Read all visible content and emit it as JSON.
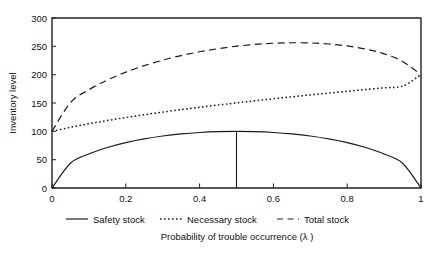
{
  "chart_data": {
    "type": "line",
    "title": "",
    "xlabel": "Probability of trouble occurrence (λ )",
    "ylabel": "Inventory level",
    "xlim": [
      0,
      1
    ],
    "ylim": [
      0,
      300
    ],
    "grid": false,
    "legend_position": "below-axis",
    "xticks": [
      "0",
      "0.2",
      "0.4",
      "0.6",
      "0.8",
      "1"
    ],
    "xtick_values": [
      0,
      0.2,
      0.4,
      0.6,
      0.8,
      1
    ],
    "yticks": [
      "0",
      "50",
      "100",
      "150",
      "200",
      "250",
      "300"
    ],
    "ytick_values": [
      0,
      50,
      100,
      150,
      200,
      250,
      300
    ],
    "x": [
      0,
      0.05,
      0.1,
      0.15,
      0.2,
      0.25,
      0.3,
      0.35,
      0.4,
      0.45,
      0.5,
      0.55,
      0.6,
      0.65,
      0.7,
      0.75,
      0.8,
      0.85,
      0.9,
      0.95,
      1
    ],
    "series": [
      {
        "name": "Safety stock",
        "style": "solid",
        "values": [
          0,
          43.6,
          60.0,
          71.4,
          80.0,
          86.6,
          91.7,
          95.4,
          98.0,
          99.5,
          100.0,
          99.5,
          98.0,
          95.4,
          91.7,
          86.6,
          80.0,
          71.4,
          60.0,
          43.6,
          0
        ]
      },
      {
        "name": "Necessary stock",
        "style": "dotted",
        "values": [
          100.0,
          107.1,
          113.4,
          119.1,
          124.4,
          129.3,
          133.9,
          138.3,
          142.4,
          146.4,
          150.2,
          153.9,
          157.5,
          160.9,
          164.3,
          167.5,
          170.7,
          173.8,
          176.8,
          179.8,
          200.0
        ]
      },
      {
        "name": "Total stock",
        "style": "dashed",
        "values": [
          100.0,
          150.7,
          173.4,
          190.5,
          204.4,
          215.9,
          225.6,
          233.7,
          240.4,
          245.9,
          250.2,
          253.4,
          255.5,
          256.3,
          256.0,
          254.1,
          250.7,
          245.2,
          236.8,
          223.4,
          200.0
        ]
      }
    ],
    "annotations": [
      {
        "name": "peak-marker",
        "type": "vertical-line",
        "x": 0.5,
        "y_from": 0,
        "y_to": 100
      }
    ]
  },
  "legend": {
    "items": [
      {
        "label": "Safety stock",
        "style": "solid"
      },
      {
        "label": "Necessary stock",
        "style": "dotted"
      },
      {
        "label": "Total stock",
        "style": "dashed"
      }
    ]
  }
}
